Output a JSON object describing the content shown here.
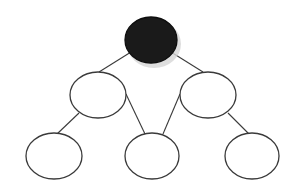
{
  "diagram": {
    "type": "binary-tree",
    "width": 293,
    "height": 186,
    "colors": {
      "root_fill": "#1a1a1a",
      "node_fill": "#ffffff",
      "stroke": "#3a3a3a",
      "shadow": "#d6d6d6",
      "background": "#ffffff"
    },
    "nodes": [
      {
        "id": "root",
        "label": "",
        "cx": 151,
        "cy": 40,
        "rx": 26,
        "ry": 23,
        "filled": true,
        "shadow": true
      },
      {
        "id": "mid-left",
        "label": "",
        "cx": 98,
        "cy": 95,
        "rx": 28,
        "ry": 23,
        "filled": false
      },
      {
        "id": "mid-right",
        "label": "",
        "cx": 208,
        "cy": 95,
        "rx": 28,
        "ry": 23,
        "filled": false
      },
      {
        "id": "bottom-left",
        "label": "",
        "cx": 54,
        "cy": 156,
        "rx": 28,
        "ry": 23,
        "filled": false
      },
      {
        "id": "bottom-center",
        "label": "",
        "cx": 152,
        "cy": 156,
        "rx": 27,
        "ry": 23,
        "filled": false
      },
      {
        "id": "bottom-right",
        "label": "",
        "cx": 252,
        "cy": 156,
        "rx": 27,
        "ry": 23,
        "filled": false
      }
    ],
    "edges": [
      {
        "from": "root",
        "to": "mid-left",
        "x1": 131,
        "y1": 52,
        "x2": 99,
        "y2": 72
      },
      {
        "from": "root",
        "to": "mid-right",
        "x1": 171,
        "y1": 52,
        "x2": 203,
        "y2": 72
      },
      {
        "from": "mid-left",
        "to": "bottom-left",
        "x1": 79,
        "y1": 113,
        "x2": 57,
        "y2": 134
      },
      {
        "from": "mid-left",
        "to": "bottom-center",
        "x1": 126,
        "y1": 94,
        "x2": 145,
        "y2": 134
      },
      {
        "from": "mid-right",
        "to": "bottom-center",
        "x1": 180,
        "y1": 94,
        "x2": 163,
        "y2": 134
      },
      {
        "from": "mid-right",
        "to": "bottom-right",
        "x1": 228,
        "y1": 113,
        "x2": 249,
        "y2": 134
      }
    ]
  }
}
